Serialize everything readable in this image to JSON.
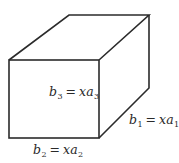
{
  "diagram": {
    "type": "rectangular-box",
    "stroke_color": "#2b2b2b",
    "vertices": {
      "front_top_left": [
        9,
        60
      ],
      "front_top_right": [
        99,
        60
      ],
      "front_bottom_left": [
        9,
        138
      ],
      "front_bottom_right": [
        99,
        138
      ],
      "back_top_left": [
        69,
        15
      ],
      "back_top_right": [
        149,
        15
      ],
      "back_bottom_right": [
        149,
        88
      ]
    },
    "labels": {
      "b3": {
        "var": "b",
        "var_sub": "3",
        "eq": "=",
        "rhs": "xa",
        "rhs_sub": "3"
      },
      "b1": {
        "var": "b",
        "var_sub": "1",
        "eq": "=",
        "rhs": "xa",
        "rhs_sub": "1"
      },
      "b2": {
        "var": "b",
        "var_sub": "2",
        "eq": "=",
        "rhs": "xa",
        "rhs_sub": "2"
      }
    }
  }
}
